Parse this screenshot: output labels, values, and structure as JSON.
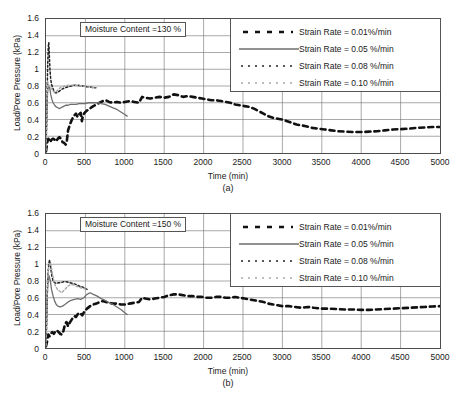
{
  "figure": {
    "panels": [
      {
        "caption": "(a)",
        "annotation": "Moisture Content =130 %"
      },
      {
        "caption": "(b)",
        "annotation": "Moisture Content =150 %"
      }
    ]
  },
  "axis": {
    "ylabel": "Load/Pore Pressure (kPa)",
    "xlabel": "Time (min)",
    "yticks": [
      "0",
      "0.2",
      "0.4",
      "0.6",
      "0.8",
      "1",
      "1.2",
      "1.4",
      "1.6"
    ],
    "xticks": [
      "0",
      "500",
      "1000",
      "1500",
      "2000",
      "2500",
      "3000",
      "3500",
      "4000",
      "4500",
      "5000"
    ]
  },
  "legend": {
    "entries": [
      {
        "label": "Strain Rate = 0.01%/min",
        "style": "dashed-thick",
        "color": "#111111"
      },
      {
        "label": "Strain Rate = 0.05 %/min",
        "style": "solid",
        "color": "#6e6e6e"
      },
      {
        "label": "Strain Rate = 0.08 %/min",
        "style": "dotted",
        "color": "#222222"
      },
      {
        "label": "Strain Rate = 0.10 %/min",
        "style": "dotted-light",
        "color": "#a8a8a8"
      }
    ]
  },
  "colors": {
    "axis": "#4d4d4d",
    "grid": "#6f6f6f",
    "series_001": "#111111",
    "series_005": "#6e6e6e",
    "series_008": "#222222",
    "series_010": "#a8a8a8"
  },
  "chart_data": [
    {
      "type": "line",
      "title": "Moisture Content =130 %",
      "subtitle": "(a)",
      "xlabel": "Time (min)",
      "ylabel": "Load/Pore Pressure (kPa)",
      "xlim": [
        0,
        5000
      ],
      "ylim": [
        0,
        1.6
      ],
      "xticks": [
        0,
        500,
        1000,
        1500,
        2000,
        2500,
        3000,
        3500,
        4000,
        4500,
        5000
      ],
      "yticks": [
        0,
        0.2,
        0.4,
        0.6,
        0.8,
        1.0,
        1.2,
        1.4,
        1.6
      ],
      "grid": true,
      "legend_position": "top-right",
      "series": [
        {
          "name": "Strain Rate = 0.01%/min",
          "color": "#111111",
          "style": "dashed-thick",
          "x": [
            0,
            10,
            20,
            30,
            40,
            55,
            70,
            90,
            110,
            130,
            150,
            170,
            190,
            210,
            230,
            250,
            265,
            280,
            300,
            320,
            340,
            360,
            380,
            400,
            420,
            440,
            455,
            470,
            490,
            510,
            540,
            570,
            600,
            640,
            680,
            720,
            760,
            800,
            850,
            900,
            950,
            1000,
            1060,
            1120,
            1180,
            1220,
            1260,
            1320,
            1380,
            1440,
            1500,
            1560,
            1620,
            1680,
            1740,
            1800,
            1860,
            1920,
            1980,
            2040,
            2100,
            2160,
            2220,
            2280,
            2340,
            2400,
            2460,
            2520,
            2580,
            2640,
            2700,
            2760,
            2820,
            2880,
            2940,
            3000,
            3060,
            3120,
            3180,
            3240,
            3300,
            3380,
            3460,
            3540,
            3620,
            3700,
            3800,
            3900,
            4000,
            4100,
            4200,
            4300,
            4400,
            4500,
            4600,
            4700,
            4800,
            4900,
            5000
          ],
          "y": [
            0.02,
            0.09,
            0.15,
            0.17,
            0.15,
            0.13,
            0.16,
            0.17,
            0.16,
            0.14,
            0.17,
            0.19,
            0.17,
            0.13,
            0.12,
            0.1,
            0.15,
            0.27,
            0.33,
            0.38,
            0.42,
            0.45,
            0.47,
            0.43,
            0.46,
            0.48,
            0.38,
            0.45,
            0.48,
            0.5,
            0.52,
            0.54,
            0.56,
            0.58,
            0.6,
            0.62,
            0.63,
            0.61,
            0.6,
            0.61,
            0.6,
            0.61,
            0.62,
            0.61,
            0.6,
            0.67,
            0.66,
            0.65,
            0.66,
            0.67,
            0.66,
            0.67,
            0.7,
            0.69,
            0.67,
            0.68,
            0.67,
            0.66,
            0.65,
            0.64,
            0.63,
            0.63,
            0.62,
            0.61,
            0.6,
            0.58,
            0.57,
            0.56,
            0.55,
            0.53,
            0.5,
            0.47,
            0.44,
            0.42,
            0.41,
            0.4,
            0.38,
            0.36,
            0.34,
            0.33,
            0.32,
            0.3,
            0.29,
            0.28,
            0.27,
            0.26,
            0.255,
            0.25,
            0.25,
            0.255,
            0.26,
            0.27,
            0.28,
            0.285,
            0.29,
            0.3,
            0.305,
            0.31,
            0.31
          ]
        },
        {
          "name": "Strain Rate = 0.05 %/min",
          "color": "#6e6e6e",
          "style": "solid",
          "x": [
            0,
            10,
            20,
            30,
            40,
            50,
            60,
            75,
            90,
            110,
            130,
            150,
            170,
            190,
            210,
            230,
            250,
            280,
            310,
            340,
            380,
            420,
            460,
            500,
            540,
            580,
            620,
            660,
            700,
            750,
            800,
            850,
            900,
            950,
            1000,
            1030
          ],
          "y": [
            0.05,
            0.45,
            0.72,
            0.8,
            0.79,
            0.76,
            0.7,
            0.64,
            0.6,
            0.57,
            0.55,
            0.54,
            0.53,
            0.54,
            0.55,
            0.56,
            0.57,
            0.57,
            0.58,
            0.58,
            0.58,
            0.59,
            0.59,
            0.59,
            0.6,
            0.6,
            0.6,
            0.6,
            0.59,
            0.58,
            0.56,
            0.54,
            0.52,
            0.49,
            0.46,
            0.44
          ]
        },
        {
          "name": "Strain Rate = 0.08 %/min",
          "color": "#222222",
          "style": "dotted",
          "x": [
            0,
            8,
            15,
            22,
            28,
            35,
            42,
            50,
            60,
            70,
            85,
            100,
            120,
            140,
            170,
            200,
            240,
            280,
            320,
            360,
            400,
            440,
            480,
            520,
            560,
            600,
            630
          ],
          "y": [
            0.02,
            0.35,
            0.78,
            1.05,
            1.25,
            1.32,
            1.18,
            1.0,
            0.88,
            0.82,
            0.78,
            0.74,
            0.72,
            0.72,
            0.74,
            0.76,
            0.78,
            0.79,
            0.8,
            0.81,
            0.81,
            0.8,
            0.8,
            0.79,
            0.79,
            0.78,
            0.78
          ]
        },
        {
          "name": "Strain Rate = 0.10 %/min",
          "color": "#a8a8a8",
          "style": "dotted-light",
          "x": [
            0,
            8,
            16,
            24,
            32,
            40,
            50,
            62,
            75,
            90,
            110,
            130,
            155,
            180,
            210,
            240,
            280,
            320,
            360,
            400,
            440,
            480,
            520,
            560,
            600,
            640
          ],
          "y": [
            0.03,
            0.4,
            0.72,
            0.85,
            0.82,
            0.8,
            0.79,
            0.78,
            0.76,
            0.74,
            0.72,
            0.73,
            0.76,
            0.78,
            0.79,
            0.8,
            0.81,
            0.81,
            0.81,
            0.8,
            0.8,
            0.8,
            0.79,
            0.79,
            0.78,
            0.78
          ]
        }
      ]
    },
    {
      "type": "line",
      "title": "Moisture Content =150 %",
      "subtitle": "(b)",
      "xlabel": "Time (min)",
      "ylabel": "Load/Pore Pressure (kPa)",
      "xlim": [
        0,
        5000
      ],
      "ylim": [
        0,
        1.6
      ],
      "xticks": [
        0,
        500,
        1000,
        1500,
        2000,
        2500,
        3000,
        3500,
        4000,
        4500,
        5000
      ],
      "yticks": [
        0,
        0.2,
        0.4,
        0.6,
        0.8,
        1.0,
        1.2,
        1.4,
        1.6
      ],
      "grid": true,
      "legend_position": "top-right",
      "series": [
        {
          "name": "Strain Rate = 0.01%/min",
          "color": "#111111",
          "style": "dashed-thick",
          "x": [
            0,
            10,
            20,
            30,
            45,
            60,
            80,
            100,
            120,
            140,
            160,
            180,
            200,
            220,
            240,
            260,
            280,
            300,
            320,
            340,
            360,
            380,
            400,
            420,
            440,
            460,
            490,
            520,
            560,
            600,
            640,
            680,
            720,
            760,
            800,
            850,
            900,
            950,
            1000,
            1060,
            1120,
            1180,
            1220,
            1260,
            1320,
            1380,
            1440,
            1500,
            1560,
            1620,
            1680,
            1740,
            1800,
            1860,
            1920,
            1980,
            2040,
            2100,
            2160,
            2220,
            2280,
            2340,
            2400,
            2460,
            2520,
            2580,
            2640,
            2700,
            2760,
            2820,
            2880,
            2940,
            3000,
            3080,
            3160,
            3240,
            3320,
            3400,
            3500,
            3600,
            3700,
            3800,
            3900,
            4000,
            4100,
            4200,
            4300,
            4400,
            4500,
            4600,
            4700,
            4800,
            4900,
            5000
          ],
          "y": [
            0.02,
            0.06,
            0.12,
            0.16,
            0.14,
            0.17,
            0.19,
            0.17,
            0.2,
            0.21,
            0.19,
            0.17,
            0.16,
            0.2,
            0.28,
            0.31,
            0.26,
            0.3,
            0.33,
            0.36,
            0.38,
            0.37,
            0.4,
            0.42,
            0.41,
            0.39,
            0.44,
            0.47,
            0.5,
            0.52,
            0.53,
            0.55,
            0.56,
            0.55,
            0.54,
            0.53,
            0.53,
            0.52,
            0.52,
            0.53,
            0.54,
            0.55,
            0.6,
            0.59,
            0.58,
            0.59,
            0.6,
            0.61,
            0.63,
            0.64,
            0.64,
            0.63,
            0.62,
            0.62,
            0.61,
            0.61,
            0.6,
            0.6,
            0.61,
            0.61,
            0.6,
            0.6,
            0.61,
            0.6,
            0.59,
            0.58,
            0.57,
            0.56,
            0.55,
            0.53,
            0.52,
            0.51,
            0.5,
            0.5,
            0.49,
            0.48,
            0.49,
            0.48,
            0.47,
            0.47,
            0.465,
            0.46,
            0.46,
            0.455,
            0.455,
            0.46,
            0.465,
            0.47,
            0.475,
            0.48,
            0.485,
            0.49,
            0.495,
            0.5
          ]
        },
        {
          "name": "Strain Rate = 0.05 %/min",
          "color": "#6e6e6e",
          "style": "solid",
          "x": [
            0,
            10,
            20,
            30,
            40,
            55,
            70,
            90,
            110,
            130,
            150,
            180,
            210,
            240,
            280,
            320,
            360,
            400,
            440,
            480,
            520,
            560,
            600,
            650,
            700,
            750,
            800,
            850,
            900,
            950,
            1000,
            1030
          ],
          "y": [
            0.04,
            0.4,
            0.72,
            0.85,
            0.86,
            0.8,
            0.7,
            0.62,
            0.56,
            0.52,
            0.5,
            0.49,
            0.5,
            0.52,
            0.55,
            0.57,
            0.58,
            0.59,
            0.58,
            0.6,
            0.64,
            0.66,
            0.64,
            0.62,
            0.59,
            0.57,
            0.54,
            0.52,
            0.49,
            0.46,
            0.42,
            0.4
          ]
        },
        {
          "name": "Strain Rate = 0.08 %/min",
          "color": "#222222",
          "style": "dotted",
          "x": [
            0,
            8,
            15,
            22,
            30,
            38,
            46,
            55,
            65,
            75,
            90,
            110,
            130,
            160,
            190,
            220,
            260,
            300,
            340,
            380,
            420,
            460,
            500,
            520
          ],
          "y": [
            0.02,
            0.3,
            0.62,
            0.82,
            0.95,
            1.02,
            1.05,
            1.0,
            0.92,
            0.86,
            0.8,
            0.78,
            0.77,
            0.78,
            0.78,
            0.79,
            0.79,
            0.78,
            0.77,
            0.76,
            0.74,
            0.73,
            0.71,
            0.7
          ]
        },
        {
          "name": "Strain Rate = 0.10 %/min",
          "color": "#a8a8a8",
          "style": "dotted-light",
          "x": [
            0,
            8,
            16,
            25,
            34,
            44,
            55,
            68,
            82,
            100,
            120,
            145,
            170,
            200,
            240,
            280,
            320,
            360,
            400,
            440,
            480,
            520
          ],
          "y": [
            0.03,
            0.35,
            0.66,
            0.84,
            0.95,
            1.0,
            1.02,
            0.97,
            0.88,
            0.8,
            0.74,
            0.7,
            0.68,
            0.66,
            0.7,
            0.74,
            0.76,
            0.75,
            0.73,
            0.72,
            0.71,
            0.7
          ]
        }
      ]
    }
  ]
}
